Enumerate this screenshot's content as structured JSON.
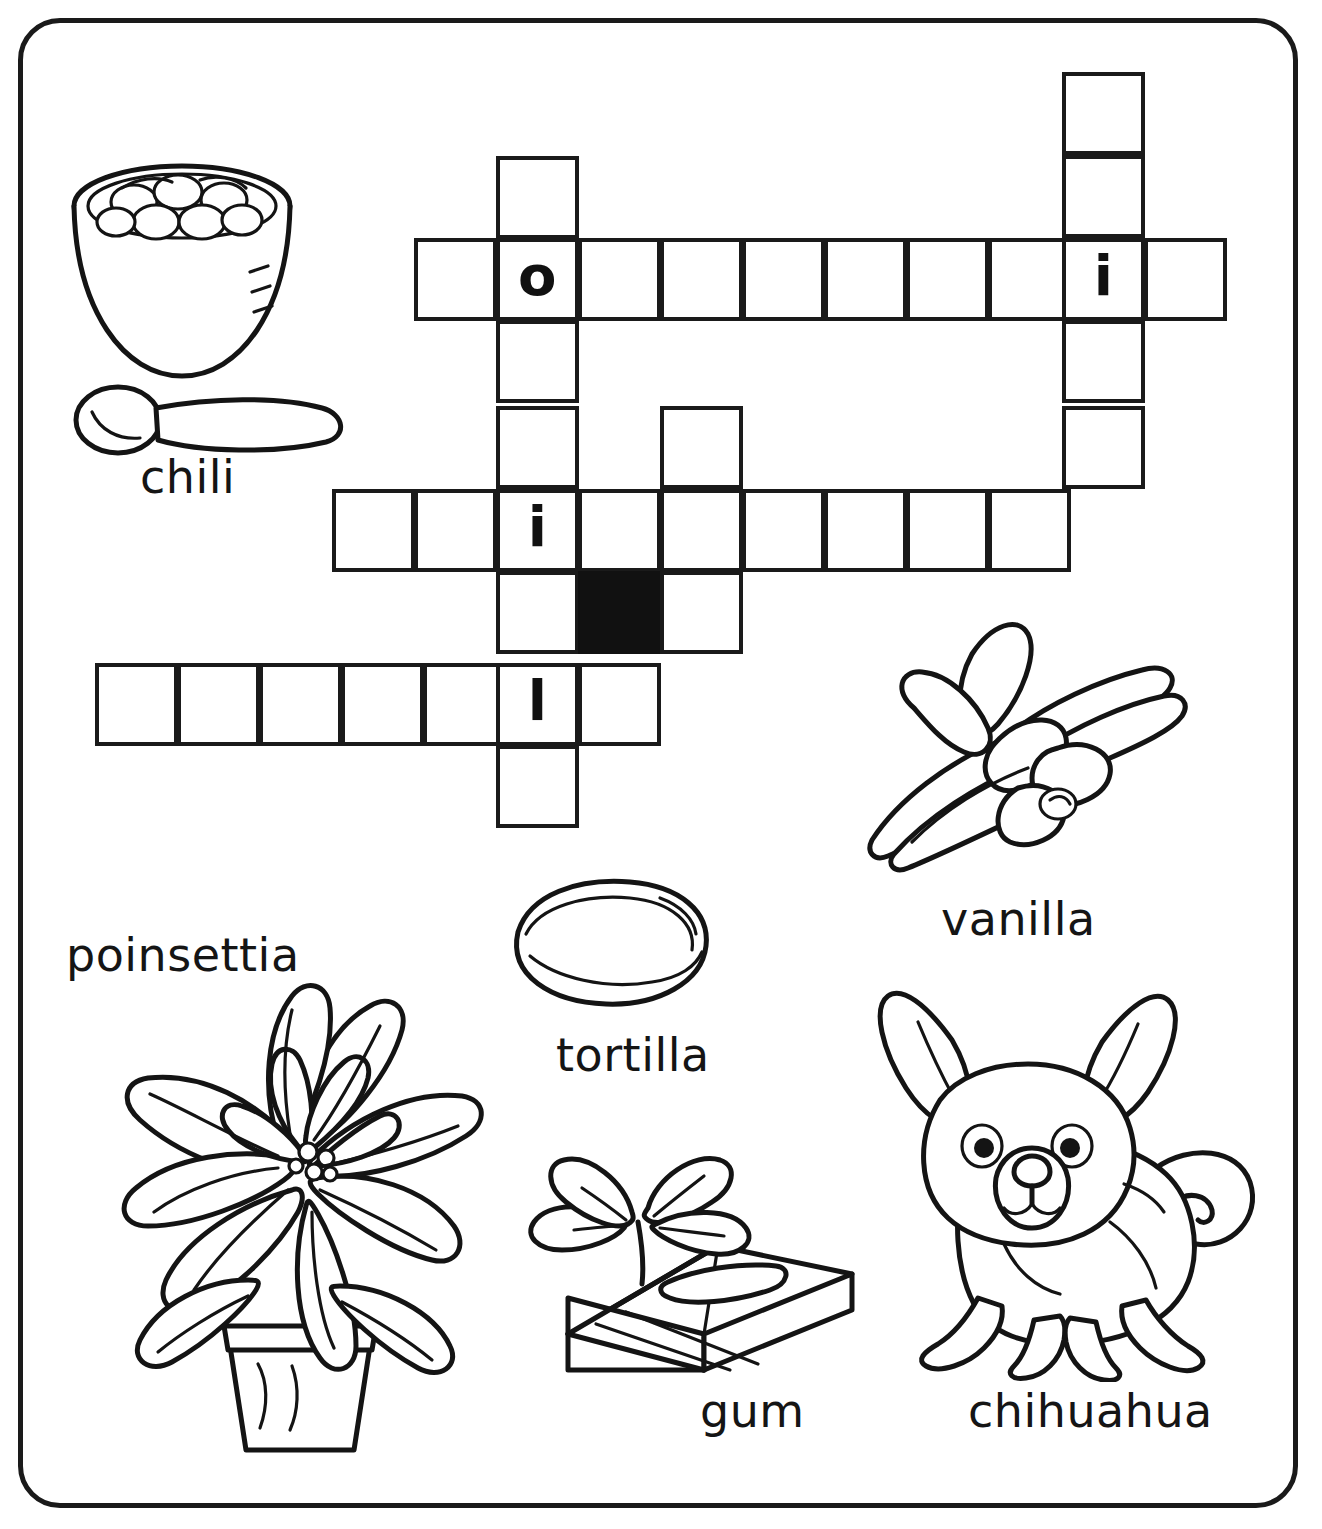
{
  "worksheet": {
    "title": "Spanish Loanwords Picture Crossword",
    "border_color": "#1a1a1a",
    "ink_color": "#141414",
    "paper_color": "#ffffff"
  },
  "crossword": {
    "cell_size": 82.5,
    "blocked_color": "#111111",
    "entries": [
      {
        "id": "vertical-right",
        "direction": "down",
        "length": 4,
        "letters": [
          "",
          "",
          "i",
          ""
        ]
      },
      {
        "id": "across-top",
        "direction": "across",
        "length": 10,
        "letters": [
          "",
          "o",
          "",
          "",
          "",
          "",
          "",
          "",
          "i",
          ""
        ]
      },
      {
        "id": "vertical-long",
        "direction": "down",
        "length": 8,
        "letters": [
          "",
          "o",
          "",
          "",
          "i",
          "",
          "l",
          ""
        ]
      },
      {
        "id": "vertical-short",
        "direction": "down",
        "length": 3,
        "letters": [
          "",
          "",
          ""
        ]
      },
      {
        "id": "across-middle",
        "direction": "across",
        "length": 9,
        "letters": [
          "",
          "",
          "i",
          "",
          "",
          "",
          "",
          "",
          ""
        ]
      },
      {
        "id": "across-bottom",
        "direction": "across",
        "length": 7,
        "letters": [
          "",
          "",
          "",
          "",
          "",
          "l",
          ""
        ]
      }
    ],
    "cells": [
      {
        "name": "cell-r1c8",
        "x": 1062,
        "y": 72,
        "letter": ""
      },
      {
        "name": "cell-r2c8",
        "x": 1062,
        "y": 155,
        "letter": ""
      },
      {
        "name": "cell-r3c0",
        "x": 414,
        "y": 238,
        "letter": ""
      },
      {
        "name": "cell-r3c1",
        "x": 496,
        "y": 238,
        "letter": "o"
      },
      {
        "name": "cell-r3c2",
        "x": 578,
        "y": 238,
        "letter": ""
      },
      {
        "name": "cell-r3c3",
        "x": 660,
        "y": 238,
        "letter": ""
      },
      {
        "name": "cell-r3c4",
        "x": 742,
        "y": 238,
        "letter": ""
      },
      {
        "name": "cell-r3c5",
        "x": 824,
        "y": 238,
        "letter": ""
      },
      {
        "name": "cell-r3c6",
        "x": 906,
        "y": 238,
        "letter": ""
      },
      {
        "name": "cell-r3c7",
        "x": 988,
        "y": 238,
        "letter": ""
      },
      {
        "name": "cell-r3c8",
        "x": 1062,
        "y": 238,
        "letter": "i"
      },
      {
        "name": "cell-r3c9",
        "x": 1144,
        "y": 238,
        "letter": ""
      },
      {
        "name": "cell-r2c1",
        "x": 496,
        "y": 156,
        "letter": ""
      },
      {
        "name": "cell-r4c1",
        "x": 496,
        "y": 320,
        "letter": ""
      },
      {
        "name": "cell-r5c1",
        "x": 496,
        "y": 406,
        "letter": ""
      },
      {
        "name": "cell-r4c8",
        "x": 1062,
        "y": 320,
        "letter": ""
      },
      {
        "name": "cell-r5c8",
        "x": 1062,
        "y": 406,
        "letter": ""
      },
      {
        "name": "cell-r5c3",
        "x": 660,
        "y": 406,
        "letter": ""
      },
      {
        "name": "cell-r6c-1",
        "x": 332,
        "y": 489,
        "letter": ""
      },
      {
        "name": "cell-r6c0",
        "x": 414,
        "y": 489,
        "letter": ""
      },
      {
        "name": "cell-r6c1",
        "x": 496,
        "y": 489,
        "letter": "i"
      },
      {
        "name": "cell-r6c2",
        "x": 578,
        "y": 489,
        "letter": ""
      },
      {
        "name": "cell-r6c3",
        "x": 660,
        "y": 489,
        "letter": ""
      },
      {
        "name": "cell-r6c4",
        "x": 742,
        "y": 489,
        "letter": ""
      },
      {
        "name": "cell-r6c5",
        "x": 824,
        "y": 489,
        "letter": ""
      },
      {
        "name": "cell-r6c6",
        "x": 906,
        "y": 489,
        "letter": ""
      },
      {
        "name": "cell-r6c7",
        "x": 988,
        "y": 489,
        "letter": ""
      },
      {
        "name": "cell-r7c1",
        "x": 496,
        "y": 571,
        "letter": ""
      },
      {
        "name": "cell-r7c2-blocked",
        "x": 578,
        "y": 571,
        "letter": "",
        "blocked": true
      },
      {
        "name": "cell-r7c3",
        "x": 660,
        "y": 571,
        "letter": ""
      },
      {
        "name": "cell-r8c-5",
        "x": 95,
        "y": 663,
        "letter": ""
      },
      {
        "name": "cell-r8c-4",
        "x": 177,
        "y": 663,
        "letter": ""
      },
      {
        "name": "cell-r8c-3",
        "x": 259,
        "y": 663,
        "letter": ""
      },
      {
        "name": "cell-r8c-2",
        "x": 341,
        "y": 663,
        "letter": ""
      },
      {
        "name": "cell-r8c-1",
        "x": 423,
        "y": 663,
        "letter": ""
      },
      {
        "name": "cell-r8c1",
        "x": 496,
        "y": 663,
        "letter": "l"
      },
      {
        "name": "cell-r8c2",
        "x": 578,
        "y": 663,
        "letter": ""
      },
      {
        "name": "cell-r9c1",
        "x": 496,
        "y": 745,
        "letter": ""
      }
    ]
  },
  "pictures": [
    {
      "id": "chili",
      "label": "chili",
      "label_x": 140,
      "label_y": 450
    },
    {
      "id": "vanilla",
      "label": "vanilla",
      "label_x": 941,
      "label_y": 892
    },
    {
      "id": "poinsettia",
      "label": "poinsettia",
      "label_x": 66,
      "label_y": 928
    },
    {
      "id": "tortilla",
      "label": "tortilla",
      "label_x": 556,
      "label_y": 1028
    },
    {
      "id": "gum",
      "label": "gum",
      "label_x": 700,
      "label_y": 1384
    },
    {
      "id": "chihuahua",
      "label": "chihuahua",
      "label_x": 968,
      "label_y": 1384
    }
  ]
}
